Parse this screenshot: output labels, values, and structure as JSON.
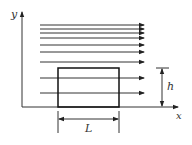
{
  "diagram": {
    "type": "flow-over-rectangular-obstacle",
    "axes": {
      "x_label": "x",
      "y_label": "y"
    },
    "flow_lines": {
      "count": 9,
      "direction": "right",
      "y_positions": [
        25,
        29,
        33,
        38,
        45,
        52,
        62,
        78,
        93
      ]
    },
    "obstacle": {
      "shape": "rectangle",
      "width_label": "L",
      "height_label": "h"
    },
    "colors": {
      "stroke": "#222222",
      "background": "#ffffff"
    }
  }
}
